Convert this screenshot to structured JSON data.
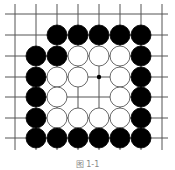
{
  "diagram": {
    "type": "go-board",
    "grid": {
      "x_lines": [
        15,
        36,
        57,
        78,
        99,
        120,
        141,
        162
      ],
      "y_lines": [
        14,
        35,
        56,
        77,
        97,
        118,
        138
      ],
      "x_extent": [
        5,
        168
      ],
      "y_extent": [
        4,
        150
      ]
    },
    "stone_radius": 10,
    "stones": [
      {
        "color": "black",
        "x": 57,
        "y": 35
      },
      {
        "color": "black",
        "x": 78,
        "y": 35
      },
      {
        "color": "black",
        "x": 99,
        "y": 35
      },
      {
        "color": "black",
        "x": 120,
        "y": 35
      },
      {
        "color": "black",
        "x": 141,
        "y": 35
      },
      {
        "color": "black",
        "x": 36,
        "y": 56
      },
      {
        "color": "black",
        "x": 57,
        "y": 56
      },
      {
        "color": "white",
        "x": 78,
        "y": 56
      },
      {
        "color": "white",
        "x": 99,
        "y": 56
      },
      {
        "color": "white",
        "x": 120,
        "y": 56
      },
      {
        "color": "black",
        "x": 141,
        "y": 56
      },
      {
        "color": "black",
        "x": 36,
        "y": 77
      },
      {
        "color": "white",
        "x": 57,
        "y": 77
      },
      {
        "color": "white",
        "x": 78,
        "y": 77
      },
      {
        "color": "white",
        "x": 120,
        "y": 77
      },
      {
        "color": "black",
        "x": 141,
        "y": 77
      },
      {
        "color": "black",
        "x": 36,
        "y": 97
      },
      {
        "color": "white",
        "x": 57,
        "y": 97
      },
      {
        "color": "white",
        "x": 120,
        "y": 97
      },
      {
        "color": "black",
        "x": 141,
        "y": 97
      },
      {
        "color": "black",
        "x": 36,
        "y": 118
      },
      {
        "color": "white",
        "x": 57,
        "y": 118
      },
      {
        "color": "white",
        "x": 78,
        "y": 118
      },
      {
        "color": "white",
        "x": 99,
        "y": 118
      },
      {
        "color": "white",
        "x": 120,
        "y": 118
      },
      {
        "color": "black",
        "x": 141,
        "y": 118
      },
      {
        "color": "black",
        "x": 36,
        "y": 138
      },
      {
        "color": "black",
        "x": 57,
        "y": 138
      },
      {
        "color": "black",
        "x": 78,
        "y": 138
      },
      {
        "color": "black",
        "x": 99,
        "y": 138
      },
      {
        "color": "black",
        "x": 120,
        "y": 138
      },
      {
        "color": "black",
        "x": 141,
        "y": 138
      }
    ],
    "star_point": {
      "x": 99,
      "y": 77
    },
    "caption": "图 1-1"
  },
  "colors": {
    "line": "#555555",
    "black": "#000000",
    "white": "#ffffff"
  }
}
